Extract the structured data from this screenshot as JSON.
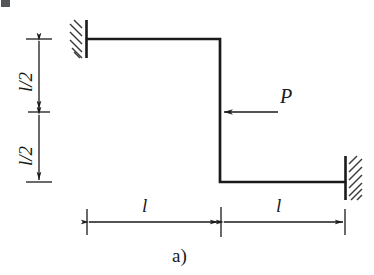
{
  "figure": {
    "caption": "a)",
    "type": "structural-frame-diagram"
  },
  "colors": {
    "line": "#1a1a1a",
    "thin_line": "#2b2b2b",
    "hatch": "#3a3a3a",
    "background": "#ffffff",
    "corner_mark": "#55565a"
  },
  "labels": {
    "force": "P",
    "length_left": "l",
    "length_right": "l",
    "height_top": "l/2",
    "height_bottom": "l/2"
  },
  "geometry": {
    "top_beam": {
      "x1": 87,
      "y1": 39,
      "x2": 220,
      "y2": 39
    },
    "vertical_member": {
      "x1": 220,
      "y1": 39,
      "x2": 220,
      "y2": 182
    },
    "bottom_beam": {
      "x1": 220,
      "y1": 182,
      "x2": 345,
      "y2": 182
    },
    "left_support": {
      "x": 87,
      "y_top": 20,
      "y_bottom": 58,
      "hatch_side": "left"
    },
    "right_support": {
      "x": 345,
      "y_top": 156,
      "y_bottom": 200,
      "hatch_side": "right"
    },
    "force_arrow": {
      "tail_x": 278,
      "tip_x": 222,
      "y": 112,
      "direction": "left"
    },
    "vertical_dimension": {
      "x": 39,
      "y_top": 39,
      "y_mid": 112,
      "y_bottom": 182
    },
    "horizontal_dimension": {
      "y": 222,
      "x_left": 87,
      "x_mid": 221,
      "x_right": 345
    }
  }
}
